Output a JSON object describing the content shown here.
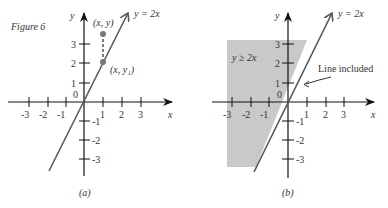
{
  "figure": {
    "title": "Figure 6",
    "panel_a": {
      "caption": "(a)",
      "line_label": "y = 2x",
      "x_axis_label": "x",
      "y_axis_label": "y",
      "origin_label": "0",
      "x_ticks": [
        "-3",
        "-2",
        "-1",
        "1",
        "2",
        "3"
      ],
      "y_ticks": [
        "3",
        "2",
        "1",
        "-1",
        "-2",
        "-3"
      ],
      "point_upper_label": "(x, y)",
      "point_lower_label": "(x, y₁)"
    },
    "panel_b": {
      "caption": "(b)",
      "line_label": "y = 2x",
      "x_axis_label": "x",
      "y_axis_label": "y",
      "origin_label": "0",
      "x_ticks": [
        "-3",
        "-2",
        "-1",
        "1",
        "2",
        "3"
      ],
      "y_ticks": [
        "3",
        "2",
        "1",
        "-1",
        "-2",
        "-3"
      ],
      "region_label": "y ≥ 2x",
      "annotation": "Line included"
    }
  },
  "colors": {
    "axis": "#1a1a1a",
    "line": "#555555",
    "shade": "#c8c8c8",
    "point": "#666666"
  }
}
